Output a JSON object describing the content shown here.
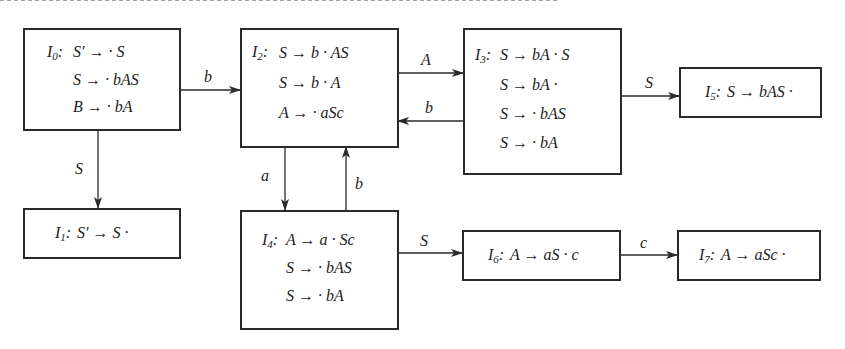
{
  "diagram": {
    "type": "LR(0) item-set automaton",
    "states": [
      {
        "id": "I0",
        "name": "I",
        "sub": "0",
        "items": [
          "S′ → · S",
          "S → · bAS",
          "B → · bA"
        ]
      },
      {
        "id": "I1",
        "name": "I",
        "sub": "1",
        "items": [
          "S′ → S ·"
        ]
      },
      {
        "id": "I2",
        "name": "I",
        "sub": "2",
        "items": [
          "S → b · AS",
          "S → b · A",
          "A → · aSc"
        ]
      },
      {
        "id": "I3",
        "name": "I",
        "sub": "3",
        "items": [
          "S → bA · S",
          "S → bA ·",
          "S → · bAS",
          "S → · bA"
        ]
      },
      {
        "id": "I4",
        "name": "I",
        "sub": "4",
        "items": [
          "A → a · Sc",
          "S → · bAS",
          "S → · bA"
        ]
      },
      {
        "id": "I5",
        "name": "I",
        "sub": "5",
        "items": [
          "S → bAS ·"
        ]
      },
      {
        "id": "I6",
        "name": "I",
        "sub": "6",
        "items": [
          "A → aS · c"
        ]
      },
      {
        "id": "I7",
        "name": "I",
        "sub": "7",
        "items": [
          "A → aSc ·"
        ]
      }
    ],
    "edges": [
      {
        "from": "I0",
        "to": "I2",
        "label": "b"
      },
      {
        "from": "I0",
        "to": "I1",
        "label": "S"
      },
      {
        "from": "I2",
        "to": "I3",
        "label": "A"
      },
      {
        "from": "I3",
        "to": "I2",
        "label": "b"
      },
      {
        "from": "I2",
        "to": "I4",
        "label": "a"
      },
      {
        "from": "I4",
        "to": "I2",
        "label": "b"
      },
      {
        "from": "I3",
        "to": "I5",
        "label": "S"
      },
      {
        "from": "I4",
        "to": "I6",
        "label": "S"
      },
      {
        "from": "I6",
        "to": "I7",
        "label": "c"
      }
    ]
  }
}
